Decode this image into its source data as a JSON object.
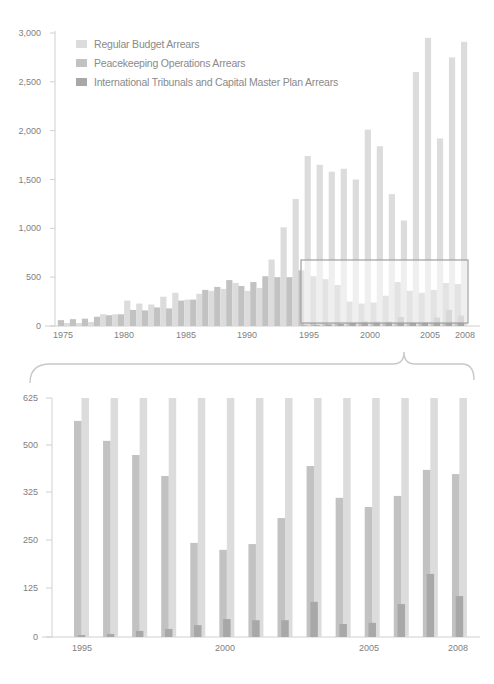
{
  "legend": {
    "items": [
      {
        "label": "Regular Budget Arrears",
        "color": "#dcdcdc"
      },
      {
        "label": "Peacekeeping Operations Arrears",
        "color": "#c2c2c2"
      },
      {
        "label": "International Tribunals and Capital Master Plan Arrears",
        "color": "#a8a8a8"
      }
    ]
  },
  "colors": {
    "light": "#dcdcdc",
    "mid": "#c2c2c2",
    "dark": "#a8a8a8",
    "axis": "#d0d0d0",
    "box": "#a0a0a0"
  },
  "chart_data": [
    {
      "type": "bar",
      "title": "",
      "xlabel": "",
      "ylabel": "",
      "ylim": [
        0,
        3000
      ],
      "yticks": [
        "0",
        "500",
        "1,000",
        "1,500",
        "2,000",
        "2,500",
        "3,000"
      ],
      "xticks": [
        "1975",
        "1980",
        "1985",
        "1990",
        "1995",
        "2000",
        "2005",
        "2008"
      ],
      "legend_position": "top-left",
      "grid": false,
      "categories": [
        1975,
        1976,
        1977,
        1978,
        1979,
        1980,
        1981,
        1982,
        1983,
        1984,
        1985,
        1986,
        1987,
        1988,
        1989,
        1990,
        1991,
        1992,
        1993,
        1994,
        1995,
        1996,
        1997,
        1998,
        1999,
        2000,
        2001,
        2002,
        2003,
        2004,
        2005,
        2006,
        2007,
        2008
      ],
      "series": [
        {
          "name": "Regular Budget Arrears (left bar)",
          "values": [
            60,
            70,
            75,
            95,
            110,
            120,
            165,
            160,
            190,
            180,
            260,
            270,
            370,
            400,
            470,
            410,
            450,
            510,
            500,
            500,
            570,
            510,
            480,
            420,
            250,
            230,
            240,
            310,
            450,
            360,
            340,
            370,
            440,
            430
          ]
        },
        {
          "name": "Peacekeeping Operations Arrears (right bar)",
          "values": [
            30,
            30,
            40,
            120,
            120,
            260,
            230,
            220,
            300,
            340,
            270,
            330,
            360,
            380,
            440,
            360,
            390,
            680,
            1010,
            1300,
            1740,
            1650,
            1580,
            1610,
            1500,
            2010,
            1840,
            1350,
            1080,
            2600,
            2950,
            1920,
            2750,
            2910
          ]
        },
        {
          "name": "International Tribunals and Capital Master Plan Arrears",
          "values": [
            0,
            0,
            0,
            0,
            0,
            0,
            0,
            0,
            0,
            0,
            0,
            0,
            0,
            0,
            0,
            0,
            0,
            0,
            0,
            0,
            5,
            8,
            16,
            21,
            31,
            47,
            44,
            44,
            92,
            34,
            37,
            86,
            165,
            107
          ]
        }
      ]
    },
    {
      "type": "bar",
      "title": "",
      "xlabel": "",
      "ylabel": "",
      "ylim": [
        0,
        625
      ],
      "yticks": [
        "0",
        "125",
        "250",
        "325",
        "500",
        "625"
      ],
      "xticks": [
        "1995",
        "2000",
        "2005",
        "2008"
      ],
      "grid": false,
      "categories": [
        1995,
        1996,
        1997,
        1998,
        1999,
        2000,
        2001,
        2002,
        2003,
        2004,
        2005,
        2006,
        2007,
        2008
      ],
      "series": [
        {
          "name": "Regular Budget Arrears (left bar)",
          "values": [
            565,
            513,
            476,
            421,
            246,
            228,
            243,
            311,
            447,
            364,
            340,
            369,
            437,
            426
          ]
        },
        {
          "name": "Peacekeeping Operations Arrears (truncated at 625)",
          "values": [
            625,
            625,
            625,
            625,
            625,
            625,
            625,
            625,
            625,
            625,
            625,
            625,
            625,
            625
          ]
        },
        {
          "name": "International Tribunals and Capital Master Plan Arrears",
          "values": [
            5,
            8,
            16,
            21,
            31,
            47,
            44,
            44,
            92,
            34,
            37,
            86,
            165,
            107
          ]
        }
      ]
    }
  ]
}
